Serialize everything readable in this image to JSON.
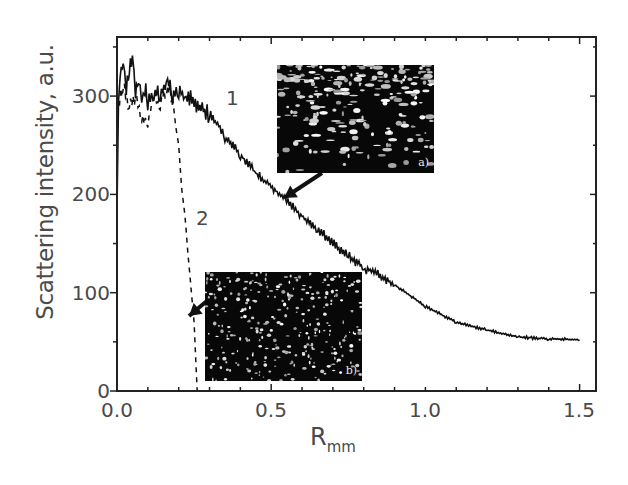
{
  "chart_data": {
    "type": "line",
    "title": "",
    "xlabel": "R",
    "xlabel_subscript": "mm",
    "ylabel": "Scattering intensity, a.u.",
    "xlim": [
      0.0,
      1.55
    ],
    "ylim": [
      0,
      360
    ],
    "grid": false,
    "legend": "none (curves labeled inline '1' and '2')",
    "x_ticks": [
      "0.0",
      "0.5",
      "1.0",
      "1.5"
    ],
    "y_ticks": [
      "0",
      "100",
      "200",
      "300"
    ],
    "series": [
      {
        "name": "1",
        "style": "solid",
        "x": [
          0.0,
          0.005,
          0.01,
          0.02,
          0.03,
          0.04,
          0.05,
          0.06,
          0.07,
          0.08,
          0.09,
          0.1,
          0.12,
          0.14,
          0.16,
          0.18,
          0.2,
          0.22,
          0.25,
          0.28,
          0.3,
          0.33,
          0.35,
          0.38,
          0.4,
          0.45,
          0.5,
          0.55,
          0.6,
          0.65,
          0.7,
          0.75,
          0.8,
          0.85,
          0.9,
          1.0,
          1.1,
          1.2,
          1.3,
          1.4,
          1.5
        ],
        "y": [
          190,
          300,
          320,
          338,
          310,
          325,
          342,
          300,
          318,
          295,
          310,
          290,
          305,
          298,
          318,
          300,
          305,
          300,
          294,
          285,
          282,
          270,
          258,
          250,
          240,
          222,
          208,
          195,
          178,
          165,
          150,
          138,
          125,
          118,
          108,
          86,
          70,
          62,
          55,
          53,
          52
        ]
      },
      {
        "name": "2",
        "style": "dashed",
        "x": [
          0.0,
          0.02,
          0.04,
          0.06,
          0.08,
          0.1,
          0.12,
          0.14,
          0.16,
          0.18,
          0.19,
          0.2,
          0.21,
          0.22,
          0.23,
          0.24,
          0.25,
          0.255,
          0.26
        ],
        "y": [
          285,
          310,
          290,
          300,
          280,
          275,
          300,
          290,
          305,
          300,
          270,
          250,
          205,
          180,
          140,
          105,
          70,
          35,
          0
        ]
      }
    ],
    "annotations": [
      {
        "text": "1",
        "x": 0.37,
        "y": 300
      },
      {
        "text": "2",
        "x": 0.27,
        "y": 175
      },
      {
        "text": "a)",
        "type": "inset-image",
        "description": "dark micrograph, arrow pointing to curve 1 at R≈0.55"
      },
      {
        "text": "b)",
        "type": "inset-image",
        "description": "dark micrograph with scattered bright spots, arrow pointing to curve 2 at R≈0.24"
      }
    ]
  },
  "axes": {
    "ylabel": "Scattering intensity, a.u.",
    "xlabel_main": "R",
    "xlabel_sub": "mm",
    "yticks": [
      "0",
      "100",
      "200",
      "300"
    ],
    "xticks": [
      "0.0",
      "0.5",
      "1.0",
      "1.5"
    ]
  },
  "labels": {
    "curve1": "1",
    "curve2": "2",
    "inset_a": "a)",
    "inset_b": "b)"
  },
  "colors": {
    "line": "#111111",
    "text": "#4a4a4a",
    "inset_bg": "#080808"
  }
}
